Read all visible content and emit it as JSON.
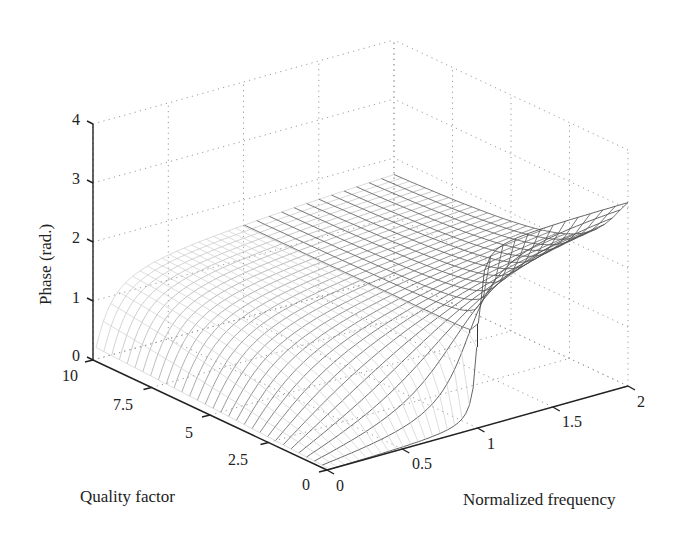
{
  "chart_data": {
    "type": "surface3d",
    "title": "",
    "zlabel": "Phase (rad.)",
    "xlabel": "Normalized frequency",
    "ylabel": "Quality factor",
    "zticks": [
      "0",
      "1",
      "2",
      "3",
      "4"
    ],
    "zlim": [
      0,
      4
    ],
    "xticks": [
      "0",
      "0.5",
      "1",
      "1.5",
      "2"
    ],
    "xlim": [
      0,
      2
    ],
    "yticks": [
      "0",
      "2.5",
      "5",
      "7.5",
      "10"
    ],
    "ylim": [
      0,
      10
    ],
    "grid": true,
    "series": [
      {
        "name": "phase surface (f<1)",
        "plateau_value": 1.57
      },
      {
        "name": "phase step at f=1",
        "max_value": 3.14
      },
      {
        "name": "phase surface (f>1)",
        "range": [
          1.57,
          3.14
        ]
      }
    ]
  }
}
